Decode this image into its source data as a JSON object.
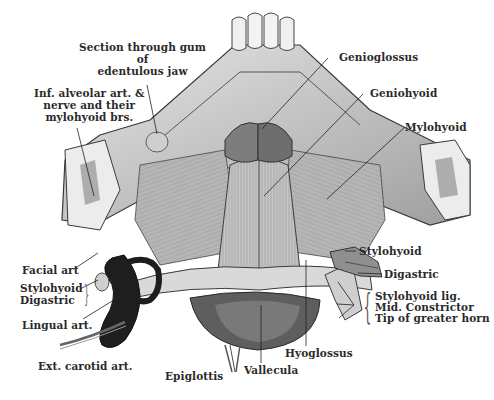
{
  "figure": {
    "style": "grayscale anatomical engraving"
  },
  "labels": {
    "section_gum": [
      "Section through gum",
      "of",
      "edentulous jaw"
    ],
    "inf_alveolar": [
      "Inf. alveolar art. &",
      "nerve and their",
      "mylohyoid brs."
    ],
    "genioglossus": "Genioglossus",
    "geniohyoid": "Geniohyoid",
    "mylohyoid": "Mylohyoid",
    "facial_art": "Facial art",
    "left_group": [
      "Stylohyoid",
      "Digastric"
    ],
    "lingual_art": "Lingual art.",
    "ext_carotid": "Ext. carotid art.",
    "epiglottis": "Epiglottis",
    "vallecula": "Vallecula",
    "hyoglossus": "Hyoglossus",
    "stylohyoid_r": "Stylohyoid",
    "digastric_r": "Digastric",
    "right_group": [
      "Stylohyoid lig.",
      "Mid. Constrictor",
      "Tip of greater horn"
    ]
  },
  "colors": {
    "background": "#ffffff",
    "ink": "#2a2a2a",
    "muscle_light": "#bdbdbd",
    "muscle_mid": "#8a8a8a",
    "bone": "#d6d6d6",
    "artery": "#1c1c1c"
  }
}
